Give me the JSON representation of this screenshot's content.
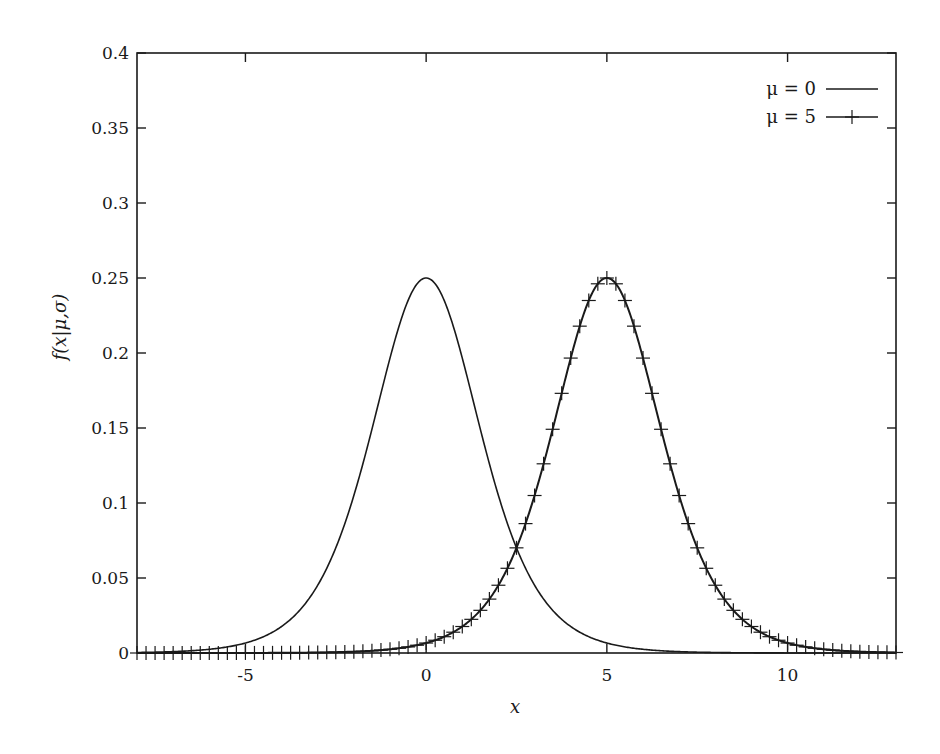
{
  "chart_data": {
    "type": "line",
    "title": "",
    "xlabel": "x",
    "ylabel": "f(x|μ,σ)",
    "xlim": [
      -8,
      13
    ],
    "ylim": [
      0,
      0.4
    ],
    "grid": false,
    "legend_position": "top-right",
    "x_ticks": [
      -5,
      0,
      5,
      10
    ],
    "x_tick_labels": [
      "-5",
      "0",
      "5",
      "10"
    ],
    "y_ticks": [
      0,
      0.05,
      0.1,
      0.15,
      0.2,
      0.25,
      0.3,
      0.35,
      0.4
    ],
    "y_tick_labels": [
      "0",
      "0.05",
      "0.1",
      "0.15",
      "0.2",
      "0.25",
      "0.3",
      "0.35",
      "0.4"
    ],
    "distribution": "logistic",
    "scale": 1,
    "peak_value": 0.25,
    "series": [
      {
        "name": "μ = 0",
        "mu": 0,
        "style": "line",
        "color": "#1a1a1a"
      },
      {
        "name": "μ = 5",
        "mu": 5,
        "style": "linespoints",
        "marker": "+",
        "marker_step": 0.25,
        "color": "#1a1a1a"
      }
    ],
    "sample_points": {
      "x": [
        -8,
        -5,
        -3,
        -2,
        -1,
        0,
        1,
        2,
        2.5,
        3,
        4,
        5,
        6,
        7,
        8,
        10,
        13
      ],
      "mu0": [
        0.0003,
        0.0066,
        0.0452,
        0.105,
        0.1966,
        0.25,
        0.1966,
        0.105,
        0.0701,
        0.0452,
        0.0177,
        0.0066,
        0.0025,
        0.0009,
        0.0003,
        0.0,
        0.0
      ],
      "mu5": [
        0.0,
        0.0,
        0.0003,
        0.0009,
        0.0025,
        0.0066,
        0.0177,
        0.0452,
        0.0701,
        0.105,
        0.1966,
        0.25,
        0.1966,
        0.105,
        0.0452,
        0.0066,
        0.0003
      ]
    }
  },
  "axes": {
    "xlabel": "x",
    "ylabel": "f(x|μ,σ)"
  },
  "legend": {
    "items": [
      {
        "label": "μ = 0"
      },
      {
        "label": "μ = 5"
      }
    ]
  }
}
